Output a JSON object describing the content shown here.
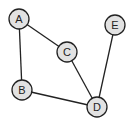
{
  "graph": {
    "node_fill": "#e2e2e2",
    "stroke": "#222222",
    "nodes": [
      {
        "id": "A",
        "label": "A",
        "x": 19,
        "y": 19
      },
      {
        "id": "B",
        "label": "B",
        "x": 22,
        "y": 90
      },
      {
        "id": "C",
        "label": "C",
        "x": 67,
        "y": 52
      },
      {
        "id": "D",
        "label": "D",
        "x": 97,
        "y": 107
      },
      {
        "id": "E",
        "label": "E",
        "x": 115,
        "y": 25
      }
    ],
    "edges": [
      {
        "from": "A",
        "to": "C"
      },
      {
        "from": "A",
        "to": "B"
      },
      {
        "from": "C",
        "to": "D"
      },
      {
        "from": "B",
        "to": "D"
      },
      {
        "from": "E",
        "to": "D"
      }
    ]
  }
}
